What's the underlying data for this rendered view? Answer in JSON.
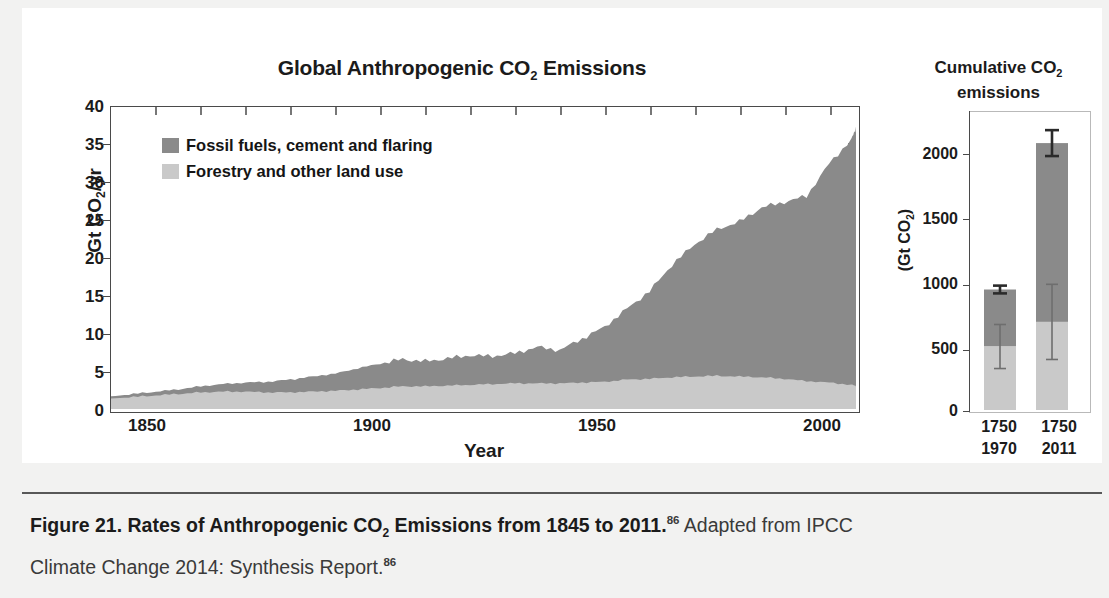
{
  "figure": {
    "caption_bold": "Figure 21. Rates of Anthropogenic CO2 Emissions from 1845 to 2011.",
    "caption_bold_part1": "Figure 21. Rates of Anthropogenic CO",
    "caption_bold_sub": "2",
    "caption_bold_part2": " Emissions from 1845 to 2011.",
    "caption_ref1": "86",
    "caption_rest1": " Adapted from IPCC",
    "caption_line2": "Climate Change 2014: Synthesis Report.",
    "caption_ref2": "86"
  },
  "colors": {
    "fossil": "#8a8a8a",
    "forestry": "#c9c9c9",
    "axis": "#4a4a4a",
    "text": "#1b1b1b",
    "page_bg": "#f2f2f1",
    "panel_bg": "#ffffff"
  },
  "main": {
    "title_part1": "Global Anthropogenic CO",
    "title_sub": "2",
    "title_part2": " Emissions",
    "ylabel_part1": "Gt CO",
    "ylabel_sub": "2",
    "ylabel_part2": "/yr",
    "xlabel": "Year",
    "yticks": [
      "40",
      "35",
      "30",
      "25",
      "20",
      "15",
      "10",
      "5",
      "0"
    ],
    "xticks": [
      "1850",
      "1900",
      "1950",
      "2000"
    ],
    "legend": [
      {
        "label": "Fossil fuels, cement and flaring",
        "color": "#8a8a8a",
        "key": "fossil"
      },
      {
        "label": "Forestry and other land use",
        "color": "#c9c9c9",
        "key": "forestry"
      }
    ]
  },
  "right": {
    "title_part1": "Cumulative CO",
    "title_sub": "2",
    "title_part2": "",
    "title_line2": "emissions",
    "ylabel_part1": "(Gt CO",
    "ylabel_sub": "2",
    "ylabel_part2": ")",
    "yticks": [
      "2000",
      "1500",
      "1000",
      "500",
      "0"
    ],
    "xlabels": [
      {
        "line1": "1750",
        "line2": "1970"
      },
      {
        "line1": "1750",
        "line2": "2011"
      }
    ]
  },
  "chart_data": [
    {
      "type": "area",
      "id": "global-anthropogenic-co2-emissions",
      "title": "Global Anthropogenic CO2 Emissions",
      "xlabel": "Year",
      "ylabel": "Gt CO2/yr",
      "xlim": [
        1845,
        2011
      ],
      "ylim": [
        0,
        40
      ],
      "yticks": [
        0,
        5,
        10,
        15,
        20,
        25,
        30,
        35,
        40
      ],
      "xticks": [
        1850,
        1900,
        1950,
        2000
      ],
      "grid": false,
      "stacked": true,
      "legend": [
        "Fossil fuels, cement and flaring",
        "Forestry and other land use"
      ],
      "legend_position": "upper-left-inside",
      "x": [
        1845,
        1850,
        1855,
        1860,
        1865,
        1870,
        1875,
        1880,
        1885,
        1890,
        1895,
        1900,
        1905,
        1910,
        1915,
        1920,
        1925,
        1930,
        1935,
        1940,
        1945,
        1950,
        1955,
        1960,
        1965,
        1970,
        1975,
        1980,
        1985,
        1990,
        1995,
        2000,
        2005,
        2010,
        2011
      ],
      "series": [
        {
          "name": "Forestry and other land use",
          "color": "#c9c9c9",
          "values": [
            1.4,
            1.6,
            1.8,
            2.0,
            2.2,
            2.3,
            2.3,
            2.2,
            2.2,
            2.3,
            2.4,
            2.6,
            2.8,
            3.0,
            3.0,
            3.1,
            3.2,
            3.3,
            3.4,
            3.4,
            3.4,
            3.5,
            3.6,
            3.9,
            4.0,
            4.2,
            4.3,
            4.4,
            4.3,
            4.2,
            4.0,
            3.7,
            3.5,
            3.2,
            3.1
          ]
        },
        {
          "name": "Fossil fuels, cement and flaring",
          "color": "#8a8a8a",
          "values": [
            0.3,
            0.4,
            0.5,
            0.6,
            0.8,
            1.0,
            1.2,
            1.4,
            1.7,
            2.0,
            2.3,
            2.8,
            3.2,
            3.6,
            3.3,
            3.6,
            3.9,
            3.7,
            4.0,
            4.8,
            4.4,
            5.8,
            7.3,
            9.4,
            11.6,
            14.9,
            17.5,
            19.4,
            20.5,
            22.5,
            23.4,
            24.5,
            29.0,
            32.5,
            34.2
          ]
        }
      ],
      "totals": [
        1.7,
        2.0,
        2.3,
        2.6,
        3.0,
        3.3,
        3.5,
        3.6,
        3.9,
        4.3,
        4.7,
        5.4,
        6.0,
        6.6,
        6.3,
        6.7,
        7.1,
        7.0,
        7.4,
        8.2,
        7.8,
        9.3,
        10.9,
        13.3,
        15.6,
        19.1,
        21.8,
        23.8,
        24.8,
        26.7,
        27.4,
        28.2,
        32.5,
        35.7,
        37.3
      ],
      "note": "Area chart of annual global anthropogenic CO2 emissions, stacked: land use (lower, light grey) and fossil fuels/cement/flaring (upper, dark grey)."
    },
    {
      "type": "bar",
      "id": "cumulative-co2-emissions",
      "title": "Cumulative CO2 emissions",
      "ylabel": "(Gt CO2)",
      "ylim": [
        0,
        2300
      ],
      "yticks": [
        0,
        500,
        1000,
        1500,
        2000
      ],
      "grid": false,
      "stacked": true,
      "categories": [
        "1750-1970",
        "1750-2011"
      ],
      "series": [
        {
          "name": "Forestry and other land use",
          "color": "#c9c9c9",
          "values": [
            490,
            680
          ],
          "errors": [
            170,
            290
          ]
        },
        {
          "name": "Fossil fuels, cement and flaring",
          "color": "#8a8a8a",
          "values": [
            440,
            1380
          ],
          "errors": [
            30,
            100
          ]
        }
      ],
      "totals": [
        930,
        2060
      ],
      "total_errors": [
        30,
        100
      ],
      "note": "Stacked bars of cumulative CO2 emissions with error bars on the land-use component and on the bar totals."
    }
  ]
}
